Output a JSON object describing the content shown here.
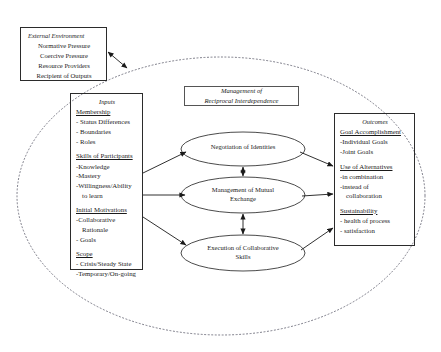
{
  "diagram": {
    "title": "Management of Reciprocal Interdependence",
    "title_line1": "Management of",
    "title_line2": "Reciprocal Interdependence"
  },
  "external_environment": {
    "caption": "External Environment",
    "items": [
      "Normative Pressure",
      "Coercive Pressure",
      "Resource Providers",
      "Recipient of Outputs"
    ]
  },
  "inputs": {
    "caption": "Inputs",
    "groups": [
      {
        "header": "Membership",
        "items": [
          "- Status Differences",
          "- Boundaries",
          "- Roles"
        ]
      },
      {
        "header": "Skills of Participants",
        "items": [
          "-Knowledge",
          "-Mastery",
          "-Willingness/Ability",
          "to learn"
        ]
      },
      {
        "header": "Initial Motivations",
        "items": [
          "-Collaborative",
          "Rationale",
          "- Goals"
        ]
      },
      {
        "header": "Scope",
        "items": [
          "- Crisis/Steady State",
          "-Temporary/On-going"
        ]
      }
    ]
  },
  "outcomes": {
    "caption": "Outcomes",
    "groups": [
      {
        "header": "Goal Accomplishment",
        "items": [
          "-Individual Goals",
          "-Joint Goals"
        ]
      },
      {
        "header": "Use of Alternatives",
        "items": [
          "-in combination",
          "-instead of",
          "collaboration"
        ]
      },
      {
        "header": "Sustainability",
        "items": [
          "- health of process",
          "- satisfaction"
        ]
      }
    ]
  },
  "processes": [
    {
      "id": "negotiation-of-identities",
      "line1": "Negotiation of Identities",
      "line2": ""
    },
    {
      "id": "management-of-mutual-exchange",
      "line1": "Management of Mutual",
      "line2": "Exchange"
    },
    {
      "id": "execution-of-collaborative-skills",
      "line1": "Execution of Collaborative",
      "line2": "Skills"
    }
  ],
  "colors": {
    "stroke": "#2b2b2b",
    "boundary": "#6b6b78",
    "background": "#ffffff"
  }
}
